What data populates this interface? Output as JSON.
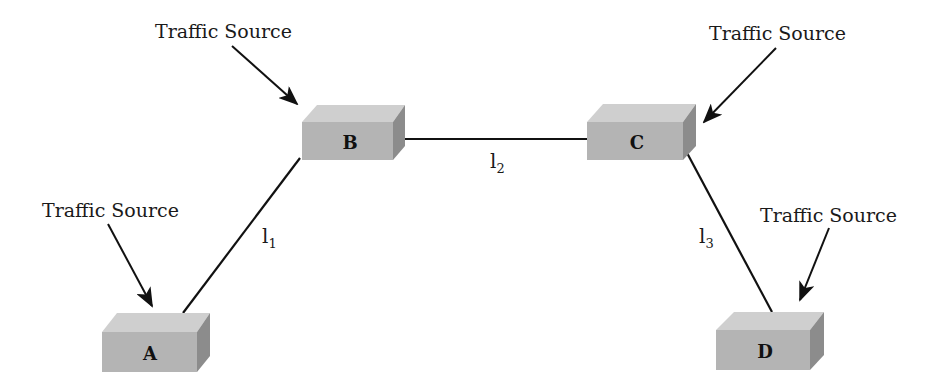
{
  "diagram": {
    "type": "network-topology",
    "nodes": [
      {
        "id": "A",
        "label": "A"
      },
      {
        "id": "B",
        "label": "B"
      },
      {
        "id": "C",
        "label": "C"
      },
      {
        "id": "D",
        "label": "D"
      }
    ],
    "links": [
      {
        "id": "l1",
        "from": "A",
        "to": "B",
        "label": "l",
        "subscript": "1"
      },
      {
        "id": "l2",
        "from": "B",
        "to": "C",
        "label": "l",
        "subscript": "2"
      },
      {
        "id": "l3",
        "from": "C",
        "to": "D",
        "label": "l",
        "subscript": "3"
      }
    ],
    "traffic_sources": [
      {
        "target": "A",
        "label": "Traffic Source"
      },
      {
        "target": "B",
        "label": "Traffic Source"
      },
      {
        "target": "C",
        "label": "Traffic Source"
      },
      {
        "target": "D",
        "label": "Traffic Source"
      }
    ],
    "colors": {
      "box_front": "#b4b4b4",
      "box_top": "#cfcfcf",
      "box_side": "#8c8c8c",
      "line": "#111111"
    }
  }
}
